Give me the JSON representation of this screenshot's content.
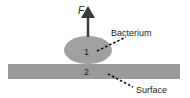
{
  "diagram": {
    "force_label": "F",
    "bacterium_label": "Bacterium",
    "surface_label": "Surface",
    "region_1": "1",
    "region_2": "2",
    "colors": {
      "bacterium_fill": "#a0a0a0",
      "surface_fill": "#9a9a9a",
      "arrow": "#3a3a3a",
      "text": "#1a1a1a"
    }
  }
}
